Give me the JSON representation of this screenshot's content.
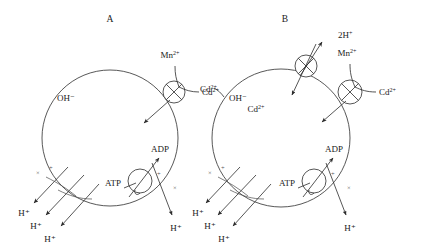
{
  "figure": {
    "background_color": "#ffffff",
    "line_color": "#2b2b2b"
  },
  "panels": [
    {
      "id": "A",
      "label": "A",
      "description": "Control cell: Cd2+ enters via the Mn2+ transporter; ATP-driven proton efflux generates membrane potential",
      "cell": {
        "cx": 110,
        "cy": 138,
        "r": 68,
        "interior_label": "OH⁻"
      },
      "transporters": [
        {
          "name": "mn-cd-transporter",
          "type": "crossed-circle",
          "cx": 174,
          "cy": 92,
          "r": 11,
          "labels": [
            "Mn²⁺",
            "Cd²⁺"
          ],
          "substrate_in": "Cd²⁺",
          "direction": "inward"
        },
        {
          "name": "atp-synthase-proton-pump",
          "type": "crossed-circle",
          "cx": 140,
          "cy": 181,
          "r": 12,
          "labels": [
            "ATP",
            "ADP",
            "H⁺"
          ],
          "direction": "outward"
        }
      ],
      "proton_efflux": {
        "name": "proton-efflux-arrows",
        "count": 3,
        "label": "H⁺",
        "labels": [
          "H⁺",
          "H⁺",
          "H⁺"
        ],
        "polarity_marks": [
          "×",
          "+"
        ]
      },
      "pump_marks": [
        "+",
        "×"
      ],
      "pump_proton_label": "H⁺"
    },
    {
      "id": "B",
      "label": "B",
      "description": "Cd-exposed cell: additional 2H+/Cd2+ antiporter extrudes Cd2+ in exchange for protons",
      "cell": {
        "cx": 281,
        "cy": 138,
        "r": 69,
        "interior_label": "OH⁻"
      },
      "transporters": [
        {
          "name": "cd-proton-antiporter",
          "type": "crossed-circle",
          "cx": 306,
          "cy": 66,
          "r": 11,
          "labels": [
            "2H⁺",
            "Cd²⁺"
          ],
          "export": "2H⁺",
          "import": "Cd²⁺",
          "direction": "antiport"
        },
        {
          "name": "mn-cd-transporter",
          "type": "crossed-circle",
          "cx": 350,
          "cy": 92,
          "r": 12,
          "labels": [
            "Mn²⁺",
            "Cd²⁺"
          ],
          "substrate_in": "Cd²⁺",
          "direction": "inward"
        },
        {
          "name": "atp-synthase-proton-pump",
          "type": "crossed-circle",
          "cx": 314,
          "cy": 181,
          "r": 12,
          "labels": [
            "ATP",
            "ADP",
            "H⁺"
          ],
          "direction": "outward"
        }
      ],
      "external_label": "Cd²⁺",
      "internal_cd_label": "Cd²⁺",
      "proton_efflux": {
        "name": "proton-efflux-arrows",
        "count": 3,
        "label": "H⁺",
        "labels": [
          "H⁺",
          "H⁺",
          "H⁺"
        ],
        "polarity_marks": [
          "×",
          "+"
        ]
      },
      "pump_marks": [
        "+",
        "×"
      ],
      "pump_proton_label": "H⁺"
    }
  ],
  "species": {
    "hydroxide": "OH⁻",
    "proton": "H⁺",
    "two_protons": "2H⁺",
    "cadmium": "Cd²⁺",
    "manganese": "Mn²⁺",
    "atp": "ATP",
    "adp": "ADP"
  }
}
